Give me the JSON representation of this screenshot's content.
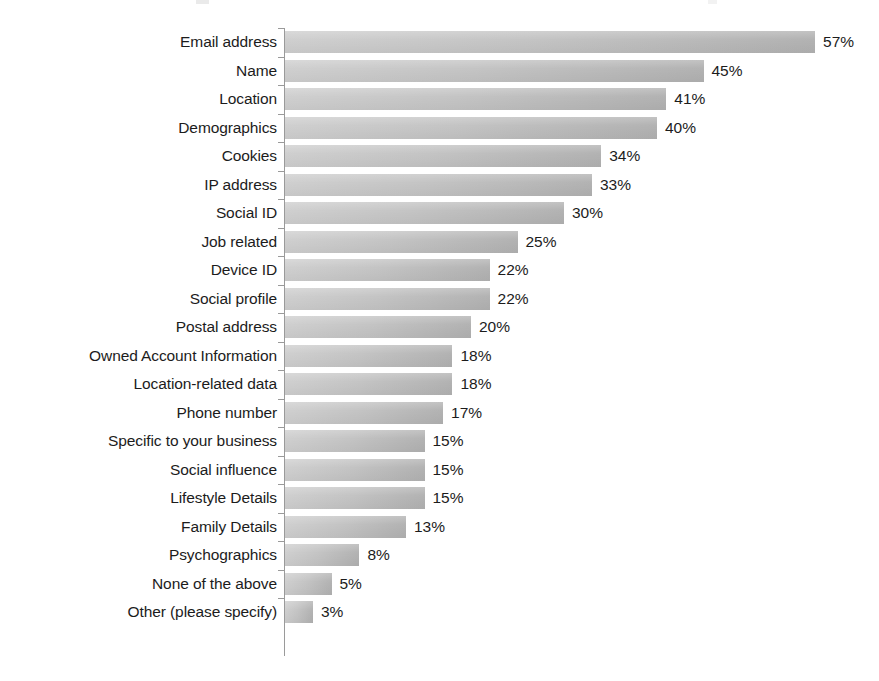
{
  "chart": {
    "title": "",
    "subtitle": "",
    "axis_suffix": "%"
  },
  "chart_data": {
    "type": "bar",
    "orientation": "horizontal",
    "title": "",
    "xlabel": "",
    "ylabel": "",
    "xlim": [
      0,
      57
    ],
    "grid": false,
    "legend": false,
    "value_suffix": "%",
    "categories": [
      "Email address",
      "Name",
      "Location",
      "Demographics",
      "Cookies",
      "IP address",
      "Social ID",
      "Job related",
      "Device ID",
      "Social profile",
      "Postal address",
      "Owned Account Information",
      "Location-related data",
      "Phone number",
      "Specific to your business",
      "Social influence",
      "Lifestyle Details",
      "Family Details",
      "Psychographics",
      "None of the above",
      "Other (please specify)"
    ],
    "values": [
      57,
      45,
      41,
      40,
      34,
      33,
      30,
      25,
      22,
      22,
      20,
      18,
      18,
      17,
      15,
      15,
      15,
      13,
      8,
      5,
      3
    ],
    "value_labels": [
      "57%",
      "45%",
      "41%",
      "40%",
      "34%",
      "33%",
      "30%",
      "25%",
      "22%",
      "22%",
      "20%",
      "18%",
      "18%",
      "17%",
      "15%",
      "15%",
      "15%",
      "13%",
      "8%",
      "5%",
      "3%"
    ],
    "series": [
      {
        "name": "Share of respondents",
        "values": [
          57,
          45,
          41,
          40,
          34,
          33,
          30,
          25,
          22,
          22,
          20,
          18,
          18,
          17,
          15,
          15,
          15,
          13,
          8,
          5,
          3
        ]
      }
    ],
    "colors": {
      "bar_light": "#cfcfcf",
      "bar_dark": "#b2b2b2",
      "axis": "#9a9a9a",
      "text": "#1c1c1c",
      "background": "#ffffff"
    },
    "scale_px_per_unit": 9.3
  }
}
